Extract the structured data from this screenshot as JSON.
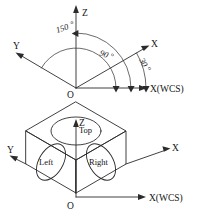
{
  "figure": {
    "line_color": "#2b2b2b",
    "background_color": "#ffffff"
  },
  "top_diagram": {
    "name": "angle-axes-diagram",
    "axes": [
      {
        "id": "z",
        "label": "Z",
        "direction": "up",
        "angle_deg": 90
      },
      {
        "id": "x",
        "label": "X",
        "direction": "upper-right",
        "angle_deg": 30
      },
      {
        "id": "y",
        "label": "Y",
        "direction": "upper-left",
        "angle_deg": 150
      },
      {
        "id": "xwcs",
        "label": "X(WCS)",
        "direction": "right",
        "angle_deg": 0
      }
    ],
    "origin_label": "O",
    "angle_arcs": [
      {
        "id": "arc-150",
        "label": "150",
        "degree_symbol": "o",
        "value": 150,
        "from_axis": "X(WCS)",
        "to_axis": "Y"
      },
      {
        "id": "arc-90",
        "label": "90",
        "degree_symbol": "o",
        "value": 90,
        "from_axis": "X(WCS)",
        "to_axis": "Z"
      },
      {
        "id": "arc-30",
        "label": "30",
        "degree_symbol": "o",
        "value": 30,
        "from_axis": "X(WCS)",
        "to_axis": "X"
      }
    ]
  },
  "bottom_diagram": {
    "name": "isometric-cube-diagram",
    "axes": [
      {
        "id": "z",
        "label": "Z",
        "direction": "up"
      },
      {
        "id": "x",
        "label": "X",
        "direction": "upper-right"
      },
      {
        "id": "y",
        "label": "Y",
        "direction": "upper-left"
      },
      {
        "id": "xwcs",
        "label": "X(WCS)",
        "direction": "right"
      }
    ],
    "origin_label": "O",
    "faces": [
      {
        "id": "top",
        "label": "Top",
        "has_ellipse": true
      },
      {
        "id": "left",
        "label": "Left",
        "has_ellipse": true
      },
      {
        "id": "right",
        "label": "Right",
        "has_ellipse": true
      }
    ]
  }
}
